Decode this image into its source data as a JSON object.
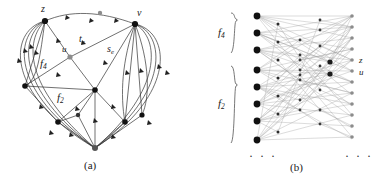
{
  "figure": {
    "panel_a": {
      "caption": "(a)",
      "labels": {
        "z": "z",
        "v": "v",
        "u": "u",
        "t_e_base": "t",
        "t_e_sub": "e",
        "s_e_base": "s",
        "s_e_sub": "e",
        "f4_base": "f",
        "f4_sub": "4",
        "f2_base": "f",
        "f2_sub": "2"
      }
    },
    "panel_b": {
      "caption": "(b)",
      "labels": {
        "f4_base": "f",
        "f4_sub": "4",
        "f2_base": "f",
        "f2_sub": "2",
        "z": "z",
        "u": "u"
      },
      "ellipsis_left": "· · ·",
      "ellipsis_right": "· · ·",
      "group_f4_count": 3,
      "group_f2_count": 5
    }
  },
  "colors": {
    "background": "#ffffff",
    "stroke": "#333333",
    "node_dark": "#111111",
    "node_gray": "#8c8c8c",
    "text": "#1a1a1a"
  }
}
